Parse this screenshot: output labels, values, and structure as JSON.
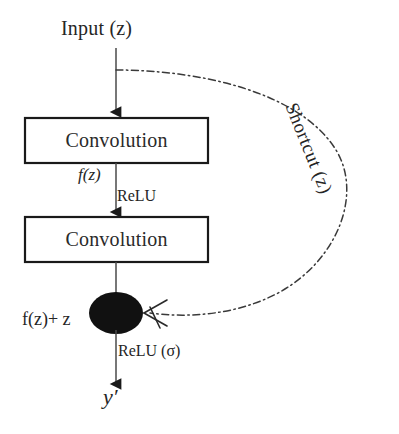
{
  "figure": {
    "type": "residual-block-diagram",
    "background_color": "#ffffff",
    "stroke_color": "#1a1a1a"
  },
  "labels": {
    "input": "Input (z)",
    "conv1": "Convolution",
    "conv2": "Convolution",
    "fz": "f(z)",
    "relu1": "ReLU",
    "sum_output": "f(z)+ z",
    "relu2": "ReLU (σ)",
    "output": "y′",
    "shortcut": "Shortcut (z)"
  },
  "nodes": [
    {
      "name": "conv-box-1",
      "label": "Convolution",
      "shape": "rectangle",
      "x": 25,
      "y": 118,
      "width": 183,
      "height": 45
    },
    {
      "name": "conv-box-2",
      "label": "Convolution",
      "shape": "rectangle",
      "x": 25,
      "y": 217,
      "width": 183,
      "height": 45
    },
    {
      "name": "addition-node",
      "label": "",
      "shape": "filled-ellipse",
      "cx": 116,
      "cy": 313,
      "rx": 27,
      "ry": 21,
      "fill": "#111111"
    }
  ],
  "edges": [
    {
      "name": "input-to-conv1",
      "style": "solid",
      "from": "input",
      "to": "conv-box-1",
      "arrowhead": "filled-triangle"
    },
    {
      "name": "conv1-to-conv2",
      "style": "solid",
      "from": "conv-box-1",
      "to": "conv-box-2",
      "label": "ReLU",
      "arrowhead": "filled-triangle"
    },
    {
      "name": "conv2-to-sum",
      "style": "solid",
      "from": "conv-box-2",
      "to": "addition-node",
      "arrowhead": "none"
    },
    {
      "name": "sum-to-output",
      "style": "solid",
      "from": "addition-node",
      "to": "output",
      "label": "ReLU (σ)",
      "arrowhead": "filled-triangle"
    },
    {
      "name": "shortcut-connection",
      "style": "dash-dot",
      "from": "input",
      "to": "addition-node",
      "label": "Shortcut (z)",
      "arrowhead": "open-barb"
    }
  ]
}
